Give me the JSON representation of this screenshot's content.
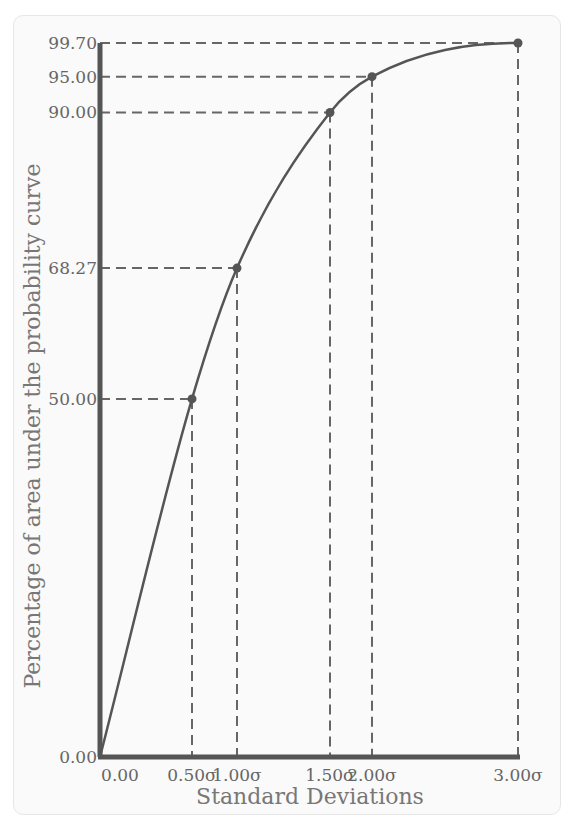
{
  "chart_data": {
    "type": "line",
    "title": "",
    "xlabel": "Standard Deviations",
    "ylabel": "Percentage of area under the probability curve",
    "x": [
      0.0,
      0.5,
      1.0,
      1.5,
      2.0,
      3.0
    ],
    "x_tick_labels": [
      "0.00",
      "0.50σ",
      "1.00σ",
      "1.50σ",
      "2.00σ",
      "3.00σ"
    ],
    "y_tick_labels": [
      "0.00",
      "50.00",
      "68.27",
      "90.00",
      "95.00",
      "99.70"
    ],
    "series": [
      {
        "name": "Cumulative area",
        "points": [
          {
            "x": 0.0,
            "y": 0.0
          },
          {
            "x": 0.5,
            "y": 50.0
          },
          {
            "x": 1.0,
            "y": 68.27
          },
          {
            "x": 1.5,
            "y": 90.0
          },
          {
            "x": 2.0,
            "y": 95.0
          },
          {
            "x": 3.0,
            "y": 99.7
          }
        ]
      }
    ],
    "highlighted_points": [
      {
        "x_label": "0.50σ",
        "y_label": "50.00"
      },
      {
        "x_label": "1.00σ",
        "y_label": "68.27"
      },
      {
        "x_label": "1.50σ",
        "y_label": "90.00"
      },
      {
        "x_label": "2.00σ",
        "y_label": "95.00"
      },
      {
        "x_label": "3.00σ",
        "y_label": "99.70"
      }
    ],
    "ylim": [
      0,
      99.7
    ],
    "xlim": [
      0,
      3
    ],
    "grid": false,
    "legend": null
  },
  "colors": {
    "curve": "#555555",
    "axis": "#555555",
    "dash": "#666666",
    "text": "#666666"
  }
}
